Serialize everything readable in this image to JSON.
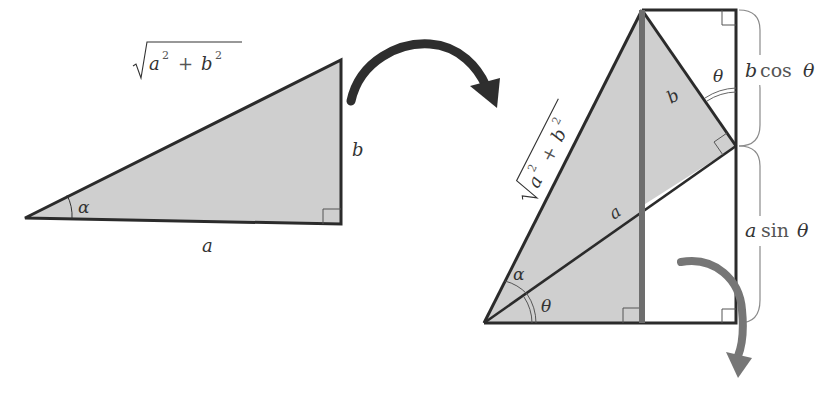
{
  "diagram": {
    "colors": {
      "fill": "#cfcfcf",
      "stroke": "#2b2b2b",
      "gray_line": "#6e6e6e",
      "gray_arrow": "#767676",
      "dark_arrow": "#2e2e2e",
      "label": "#333333",
      "brace": "#8a8a8a"
    },
    "left_triangle": {
      "hypotenuse_label": {
        "radicand_a": "a",
        "radicand_b": "b",
        "exp": "2",
        "plus": "+"
      },
      "vertical_side_label": "b",
      "base_label": "a",
      "angle_label": "α"
    },
    "right_figure": {
      "hypotenuse_label": {
        "radicand_a": "a",
        "radicand_b": "b",
        "exp": "2",
        "plus": "+"
      },
      "inner_side_b_label": "b",
      "inner_side_a_label": "a",
      "angle_alpha_label": "α",
      "angle_theta_bottom_label": "θ",
      "angle_theta_top_label": "θ",
      "brace_top": {
        "coef": "b",
        "func": "cos",
        "arg": "θ"
      },
      "brace_bottom": {
        "coef": "a",
        "func": "sin",
        "arg": "θ"
      }
    },
    "arrows": {
      "transform_arrow": "curved-arrow-right",
      "rotate_arrow": "curved-arrow-down"
    }
  }
}
